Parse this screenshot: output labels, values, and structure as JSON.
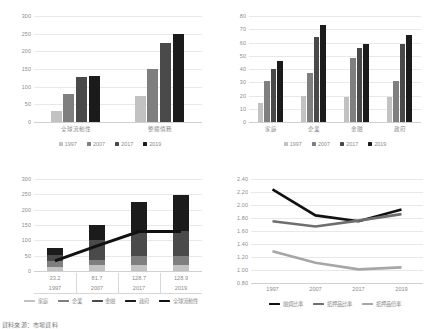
{
  "footnote": "資料來源：市場資料",
  "series_colors": {
    "y1997": "#c2c2c2",
    "y2007": "#7f7f7f",
    "y2017": "#4a4a4a",
    "y2019": "#1b1b1b",
    "line": "#111111",
    "line2": "#6e6e6e",
    "line3": "#a6a6a6"
  },
  "chart_data": [
    {
      "id": "chart-top-left",
      "type": "bar",
      "title": "",
      "categories": [
        "全球流動性",
        "整體債務"
      ],
      "series": [
        {
          "name": "1997",
          "values": [
            32,
            75
          ]
        },
        {
          "name": "2007",
          "values": [
            80,
            150
          ]
        },
        {
          "name": "2017",
          "values": [
            128,
            224
          ]
        },
        {
          "name": "2019",
          "values": [
            129,
            248
          ]
        }
      ],
      "legend": [
        "1997",
        "2007",
        "2017",
        "2019"
      ],
      "legend_position": "bottom",
      "ylabel": "",
      "xlabel": "",
      "ylim": [
        0,
        300
      ],
      "yticks": [
        0,
        50,
        100,
        150,
        200,
        250,
        300
      ],
      "ytick_labels": [
        "0",
        "50",
        "100",
        "150",
        "200",
        "250",
        "300"
      ],
      "grid": true
    },
    {
      "id": "chart-top-right",
      "type": "bar",
      "title": "",
      "categories": [
        "家庭",
        "企業",
        "金融",
        "政府"
      ],
      "series": [
        {
          "name": "1997",
          "values": [
            14,
            20,
            19,
            19
          ]
        },
        {
          "name": "2007",
          "values": [
            31,
            37,
            48,
            31
          ]
        },
        {
          "name": "2017",
          "values": [
            40,
            64,
            56,
            59
          ]
        },
        {
          "name": "2019",
          "values": [
            46,
            73,
            59,
            66
          ]
        }
      ],
      "legend": [
        "1997",
        "2007",
        "2017",
        "2019"
      ],
      "legend_position": "bottom",
      "ylabel": "",
      "xlabel": "",
      "ylim": [
        0,
        80
      ],
      "yticks": [
        0,
        10,
        20,
        30,
        40,
        50,
        60,
        70,
        80
      ],
      "ytick_labels": [
        "0",
        "10",
        "20",
        "30",
        "40",
        "50",
        "60",
        "70",
        "80"
      ],
      "grid": true
    },
    {
      "id": "chart-bottom-left",
      "type": "bar",
      "stacked": true,
      "title": "",
      "categories": [
        "1997",
        "2007",
        "2017",
        "2019"
      ],
      "data_labels": [
        "33.2",
        "81.7",
        "128.7",
        "128.9"
      ],
      "series": [
        {
          "name": "家庭",
          "values": [
            14,
            20,
            19,
            19
          ]
        },
        {
          "name": "企業",
          "values": [
            17,
            17,
            29,
            31
          ]
        },
        {
          "name": "金融",
          "values": [
            21,
            63,
            78,
            80
          ]
        },
        {
          "name": "政府",
          "values": [
            23,
            50,
            98,
            118
          ]
        },
        {
          "name": "全球流動性",
          "type": "line",
          "values": [
            33.2,
            81.7,
            128.7,
            128.9
          ]
        }
      ],
      "legend": [
        "家庭",
        "企業",
        "金融",
        "政府",
        "全球流動性"
      ],
      "legend_position": "bottom",
      "ylabel": "",
      "xlabel": "",
      "ylim": [
        0,
        300
      ],
      "yticks": [
        0,
        50,
        100,
        150,
        200,
        250,
        300
      ],
      "ytick_labels": [
        "0",
        "50",
        "100",
        "150",
        "200",
        "250",
        "300"
      ],
      "grid": true
    },
    {
      "id": "chart-bottom-right",
      "type": "line",
      "title": "",
      "x": [
        "1997",
        "2007",
        "2017",
        "2019"
      ],
      "series": [
        {
          "name": "融資比率",
          "values": [
            2.24,
            1.84,
            1.75,
            1.93
          ]
        },
        {
          "name": "抵押品比率",
          "values": [
            1.75,
            1.67,
            1.76,
            1.86
          ]
        },
        {
          "name": "抵押品倍率",
          "values": [
            1.29,
            1.11,
            1.01,
            1.04
          ]
        }
      ],
      "legend": [
        "融資比率",
        "抵押品比率",
        "抵押品倍率"
      ],
      "legend_position": "bottom",
      "ylabel": "",
      "xlabel": "",
      "ylim": [
        0.8,
        2.4
      ],
      "yticks": [
        0.8,
        1.0,
        1.2,
        1.4,
        1.6,
        1.8,
        2.0,
        2.2,
        2.4
      ],
      "ytick_labels": [
        "0.80",
        "1.00",
        "1.20",
        "1.40",
        "1.60",
        "1.80",
        "2.00",
        "2.20",
        "2.40"
      ],
      "grid": true
    }
  ]
}
